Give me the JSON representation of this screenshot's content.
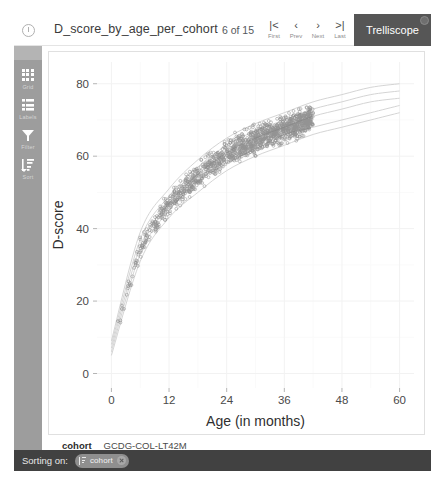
{
  "header": {
    "info_icon": "info-icon",
    "title": "D_score_by_age_per_cohort",
    "pager": {
      "count_text": "6 of 15",
      "current": 6,
      "total": 15,
      "buttons": [
        {
          "glyph": "|<",
          "label": "First",
          "name": "first"
        },
        {
          "glyph": "‹",
          "label": "Prev",
          "name": "prev"
        },
        {
          "glyph": "›",
          "label": "Next",
          "name": "next"
        },
        {
          "glyph": ">|",
          "label": "Last",
          "name": "last"
        }
      ]
    },
    "brand": "Trelliscope"
  },
  "sidebar": {
    "items": [
      {
        "label": "Grid",
        "icon": "grid-icon"
      },
      {
        "label": "Labels",
        "icon": "labels-icon"
      },
      {
        "label": "Filter",
        "icon": "filter-icon"
      },
      {
        "label": "Sort",
        "icon": "sort-icon"
      }
    ]
  },
  "meta": {
    "key": "cohort",
    "value": "GCDG-COL-LT42M"
  },
  "sorting": {
    "label": "Sorting on:",
    "chip_text": "cohort",
    "chip_icon": "sort-icon",
    "close_icon": "close-icon"
  },
  "colors": {
    "brand_bg": "#565656",
    "sidebar_bg": "#9d9d9d",
    "sortbar_bg": "#414141",
    "point": "#6f6f6f",
    "reference_curve": "#cfcfcf",
    "grid": "#f2f2f2",
    "panel_border": "#e0e0e0"
  },
  "chart_data": {
    "type": "scatter",
    "title": "",
    "xlabel": "Age (in months)",
    "ylabel": "D-score",
    "xlim": [
      -3,
      63
    ],
    "ylim": [
      -4,
      86
    ],
    "xticks": [
      0,
      12,
      24,
      36,
      48,
      60
    ],
    "yticks": [
      0,
      20,
      40,
      60,
      80
    ],
    "grid": true,
    "legend": "none",
    "series": [
      {
        "name": "D-score observations",
        "marker": "open-circle",
        "color": "#6f6f6f",
        "n_points": 1400,
        "x_range": [
          0.5,
          42
        ],
        "y_range": [
          25,
          76
        ],
        "description": "Dense band of child D-score measurements rising with age, widening slightly; concentration between 12 and 42 months."
      }
    ],
    "reference_curves": {
      "name": "D-score reference centiles",
      "color": "#cfcfcf",
      "count": 5,
      "centiles": [
        5,
        25,
        50,
        75,
        95
      ],
      "description": "Five fanned growth-reference centile curves rising steeply from near 5 D-score at age 0 toward 70-79 at age 60.",
      "anchors_x": [
        0,
        6,
        12,
        18,
        24,
        30,
        36,
        42,
        48,
        54,
        60
      ],
      "anchors_y": [
        [
          5,
          31,
          43,
          50,
          56,
          60,
          63,
          66,
          68,
          70,
          72
        ],
        [
          6,
          33,
          45,
          53,
          58,
          62,
          66,
          68,
          70,
          72,
          74
        ],
        [
          7,
          35,
          47,
          55,
          61,
          65,
          68,
          71,
          73,
          75,
          76
        ],
        [
          8,
          37,
          49,
          57,
          63,
          67,
          70,
          73,
          75,
          77,
          78
        ],
        [
          9,
          39,
          51,
          59,
          65,
          69,
          72,
          75,
          77,
          79,
          80
        ]
      ]
    }
  }
}
